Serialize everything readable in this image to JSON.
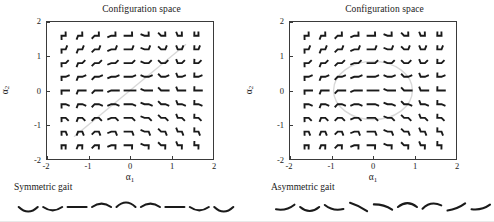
{
  "figure": {
    "background": "#ffffff",
    "ink": "#1a1a1a",
    "axis_color": "#3a3a3a",
    "path_color": "#d8d8d8"
  },
  "panels": [
    {
      "id": "left",
      "title": "Configuration space",
      "gait_caption": "Symmetric gait",
      "gait_path_type": "line",
      "y_label": "α2",
      "x_label": "α1",
      "chart_data": {
        "type": "scatter",
        "title": "Configuration space",
        "xlabel": "α1",
        "ylabel": "α2",
        "xlim": [
          -2,
          2
        ],
        "ylim": [
          -2,
          2
        ],
        "xticks": [
          -2,
          -1,
          0,
          1,
          2
        ],
        "yticks": [
          -2,
          -1,
          0,
          1,
          2
        ],
        "xticklabels": [
          "-2",
          "-1",
          "0",
          "1",
          "2"
        ],
        "yticklabels": [
          "-2",
          "-1",
          "0",
          "1",
          "2"
        ],
        "grid": false,
        "legend": "none",
        "glyph": "three-link-swimmer-shape",
        "grid_nx": 9,
        "grid_ny": 9,
        "grid_x": [
          -1.6,
          -1.2,
          -0.8,
          -0.4,
          0.0,
          0.4,
          0.8,
          1.2,
          1.6
        ],
        "grid_y": [
          1.6,
          1.2,
          0.8,
          0.4,
          0.0,
          -0.4,
          -0.8,
          -1.2,
          -1.6
        ],
        "annotation": "Each marker is a planar three-link body whose two joint angles equal (α1, α2) at that grid point.",
        "path": {
          "name": "symmetric gait",
          "shape": "straight line through origin, slope +1",
          "x": [
            -1.35,
            1.35
          ],
          "y": [
            -1.35,
            1.35
          ]
        }
      },
      "gait_sequence": {
        "count": 9,
        "shapes": [
          "u",
          "u",
          "flat",
          "n",
          "n",
          "n",
          "flat",
          "u",
          "u"
        ],
        "curvatures": [
          0.95,
          0.7,
          0.0,
          -0.7,
          -0.95,
          -0.7,
          0.0,
          0.7,
          0.95
        ],
        "tilts": [
          0,
          0,
          0,
          0,
          0,
          0,
          0,
          0,
          0
        ]
      }
    },
    {
      "id": "right",
      "title": "Configuration space",
      "gait_caption": "Asymmetric gait",
      "gait_path_type": "ellipse",
      "y_label": "α2",
      "x_label": "α1",
      "chart_data": {
        "type": "scatter",
        "title": "Configuration space",
        "xlabel": "α1",
        "ylabel": "α2",
        "xlim": [
          -2,
          2
        ],
        "ylim": [
          -2,
          2
        ],
        "xticks": [
          -2,
          -1,
          0,
          1,
          2
        ],
        "yticks": [
          -2,
          -1,
          0,
          1,
          2
        ],
        "xticklabels": [
          "-2",
          "-1",
          "0",
          "1",
          "2"
        ],
        "yticklabels": [
          "-2",
          "-1",
          "0",
          "1",
          "2"
        ],
        "grid": false,
        "legend": "none",
        "glyph": "three-link-swimmer-shape",
        "grid_nx": 9,
        "grid_ny": 9,
        "grid_x": [
          -1.6,
          -1.2,
          -0.8,
          -0.4,
          0.0,
          0.4,
          0.8,
          1.2,
          1.6
        ],
        "grid_y": [
          1.6,
          1.2,
          0.8,
          0.4,
          0.0,
          -0.4,
          -0.8,
          -1.2,
          -1.6
        ],
        "annotation": "Each marker is a planar three-link body whose two joint angles equal (α1, α2) at that grid point.",
        "path": {
          "name": "asymmetric gait",
          "shape": "closed ellipse centred on the origin",
          "center": [
            0.0,
            0.0
          ],
          "rx": 0.95,
          "ry": 0.85,
          "rotation_deg": 0
        }
      },
      "gait_sequence": {
        "count": 9,
        "shapes": [
          "tilt-left",
          "u",
          "tilt-right",
          "slash",
          "flat-rise",
          "n",
          "n",
          "tilt-down",
          "tilt-left"
        ],
        "curvatures": [
          0.45,
          0.85,
          0.5,
          -0.15,
          -0.3,
          -0.8,
          -0.7,
          0.25,
          0.4
        ],
        "tilts": [
          -14,
          0,
          12,
          26,
          16,
          0,
          -10,
          -22,
          -14
        ]
      }
    }
  ]
}
